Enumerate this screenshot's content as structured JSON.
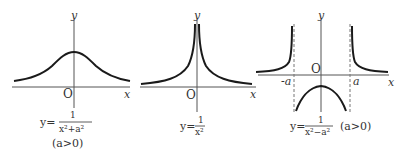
{
  "graphs": [
    {
      "id": "witch",
      "x_label": "x",
      "y_label": "y",
      "origin_label": "O",
      "equation": {
        "lhs": "y=",
        "numerator": "1",
        "denominator": "x²+a²"
      },
      "condition": "(a>0)"
    },
    {
      "id": "inverse-square",
      "x_label": "x",
      "y_label": "y",
      "origin_label": "O",
      "equation": {
        "lhs": "y=",
        "numerator": "1",
        "denominator": "x²"
      }
    },
    {
      "id": "inverse-diff-squares",
      "x_label": "x",
      "y_label": "y",
      "origin_label": "O",
      "neg_a_label": "-a",
      "pos_a_label": "a",
      "equation": {
        "lhs": "y=",
        "numerator": "1",
        "denominator": "x²−a²"
      },
      "condition": "(a>0)"
    }
  ],
  "colors": {
    "curve": "#1a1a1a",
    "axis": "#555555",
    "asymptote": "#777777"
  }
}
